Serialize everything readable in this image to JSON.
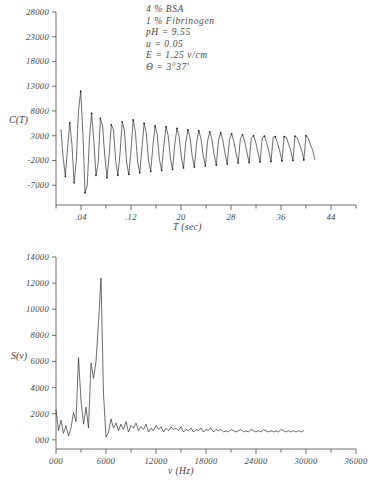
{
  "annotation": {
    "lines": [
      "4 % BSA",
      "1 % Fibrinogen",
      "pH = 9.55",
      "u = 0.05",
      "E = 1.25 v/cm",
      "Θ = 3°37'"
    ]
  },
  "chart_data": [
    {
      "type": "line",
      "title": "",
      "xlabel": "T (sec)",
      "ylabel": "C(T)",
      "xlim": [
        0.0,
        0.48
      ],
      "ylim": [
        -11000,
        28000
      ],
      "xticks": [
        0.04,
        0.12,
        0.2,
        0.28,
        0.36,
        0.44
      ],
      "xtick_labels": [
        ".04",
        ".12",
        "20",
        "28",
        "36",
        "44"
      ],
      "yticks": [
        28000,
        23000,
        18000,
        13000,
        8000,
        3000,
        -2000,
        -7000
      ],
      "ytick_labels": [
        "28000",
        "23000",
        "18000",
        "13000",
        "8000",
        "3000",
        "-2000",
        "-7000"
      ],
      "grid": false,
      "markers": "dots",
      "description": "Damped oscillatory autocorrelation function with decaying envelope and superimposed noise",
      "x": [
        0.008,
        0.0115,
        0.015,
        0.0185,
        0.022,
        0.0255,
        0.029,
        0.0325,
        0.036,
        0.0395,
        0.043,
        0.0465,
        0.05,
        0.0535,
        0.057,
        0.0605,
        0.064,
        0.0675,
        0.071,
        0.0745,
        0.078,
        0.0815,
        0.085,
        0.0885,
        0.092,
        0.0955,
        0.099,
        0.1025,
        0.106,
        0.1095,
        0.113,
        0.1165,
        0.12,
        0.1235,
        0.127,
        0.1305,
        0.134,
        0.1375,
        0.141,
        0.1445,
        0.148,
        0.1515,
        0.155,
        0.1585,
        0.162,
        0.1655,
        0.169,
        0.1725,
        0.176,
        0.1795,
        0.183,
        0.1865,
        0.19,
        0.1935,
        0.197,
        0.2005,
        0.204,
        0.2075,
        0.211,
        0.2145,
        0.218,
        0.2215,
        0.225,
        0.2285,
        0.232,
        0.2355,
        0.239,
        0.2425,
        0.246,
        0.2495,
        0.253,
        0.2565,
        0.26,
        0.2635,
        0.267,
        0.2705,
        0.274,
        0.2775,
        0.281,
        0.2845,
        0.288,
        0.2915,
        0.295,
        0.2985,
        0.302,
        0.3055,
        0.309,
        0.3125,
        0.316,
        0.3195,
        0.323,
        0.3265,
        0.33,
        0.3335,
        0.337,
        0.3405,
        0.344,
        0.3475,
        0.351,
        0.3545,
        0.358,
        0.3615,
        0.365,
        0.3685,
        0.372,
        0.3755,
        0.379,
        0.3825,
        0.386,
        0.3895,
        0.393,
        0.3965,
        0.4,
        0.4035,
        0.407,
        0.4105,
        0.414
      ],
      "y": [
        4200,
        -1500,
        -5200,
        600,
        5600,
        1200,
        -6500,
        -2000,
        8000,
        12000,
        3500,
        -8500,
        -7000,
        2500,
        7500,
        2000,
        -5000,
        -2500,
        6500,
        5000,
        -1000,
        -5500,
        -1000,
        5200,
        4200,
        -2000,
        -5000,
        -500,
        5800,
        4000,
        -2500,
        -4800,
        0,
        6200,
        3800,
        -2200,
        -4500,
        500,
        5500,
        3500,
        -2000,
        -4200,
        800,
        5000,
        3200,
        -1800,
        -4000,
        1000,
        4800,
        3000,
        -1500,
        -3800,
        1200,
        4500,
        2800,
        -1300,
        -3500,
        1500,
        4200,
        2600,
        -1200,
        -3300,
        1700,
        4000,
        2400,
        -1000,
        -3100,
        1900,
        3800,
        2200,
        -800,
        -2900,
        2000,
        3600,
        2000,
        -600,
        -2700,
        2200,
        3400,
        1900,
        -500,
        -2500,
        2400,
        3200,
        1800,
        -400,
        -2400,
        2500,
        3000,
        1700,
        -300,
        -2300,
        2600,
        2900,
        1600,
        -200,
        -2200,
        2700,
        2800,
        1500,
        -100,
        -2100,
        2800,
        2700,
        1400,
        0,
        -2000,
        2900,
        2600,
        1300,
        100,
        -1900,
        3000,
        2500,
        1200,
        200,
        -1800,
        3100
      ]
    },
    {
      "type": "line",
      "title": "",
      "xlabel": "ν (Hz)",
      "ylabel": "S(ν)",
      "xlim": [
        0,
        36000
      ],
      "ylim": [
        -700,
        14000
      ],
      "xticks": [
        0,
        6000,
        12000,
        18000,
        24000,
        30000,
        36000
      ],
      "xtick_labels": [
        "000",
        "6000",
        "12000",
        "18000",
        "24000",
        "30000",
        "36000"
      ],
      "yticks": [
        14000,
        12000,
        10000,
        8000,
        6000,
        4000,
        2000,
        0
      ],
      "ytick_labels": [
        "14000",
        "12000",
        "10000",
        "8000",
        "6000",
        "4000",
        "2000",
        "000"
      ],
      "grid": false,
      "description": "Power spectrum with dominant peak near 5600 Hz reaching about 12400, secondary peaks near 2900 Hz and 4700 Hz, and low noise floor beyond 7000 Hz ending near 30000 Hz",
      "x": [
        0,
        300,
        600,
        900,
        1200,
        1500,
        1800,
        2100,
        2400,
        2700,
        3000,
        3300,
        3600,
        3900,
        4200,
        4500,
        4800,
        5100,
        5400,
        5700,
        6000,
        6300,
        6600,
        6900,
        7200,
        7500,
        7800,
        8100,
        8400,
        8700,
        9000,
        9300,
        9600,
        9900,
        10200,
        10500,
        10800,
        11100,
        11400,
        11700,
        12000,
        12300,
        12600,
        12900,
        13200,
        13500,
        13800,
        14100,
        14400,
        14700,
        15000,
        15300,
        15600,
        15900,
        16200,
        16500,
        16800,
        17100,
        17400,
        17700,
        18000,
        18300,
        18600,
        18900,
        19200,
        19500,
        19800,
        20100,
        20400,
        20700,
        21000,
        21300,
        21600,
        21900,
        22200,
        22500,
        22800,
        23100,
        23400,
        23700,
        24000,
        24300,
        24600,
        24900,
        25200,
        25500,
        25800,
        26100,
        26400,
        26700,
        27000,
        27300,
        27600,
        27900,
        28200,
        28500,
        28800,
        29100,
        29400,
        29700,
        30000
      ],
      "y": [
        2300,
        700,
        1500,
        500,
        1100,
        300,
        900,
        2100,
        1400,
        6300,
        3000,
        1200,
        2500,
        900,
        5900,
        4700,
        6000,
        9000,
        12400,
        3500,
        200,
        600,
        1600,
        900,
        1300,
        700,
        1200,
        800,
        1400,
        600,
        1100,
        900,
        1300,
        700,
        1000,
        800,
        1200,
        600,
        900,
        700,
        1100,
        800,
        1000,
        600,
        900,
        700,
        1000,
        800,
        900,
        700,
        1000,
        600,
        800,
        700,
        900,
        600,
        800,
        700,
        900,
        600,
        800,
        700,
        900,
        600,
        800,
        700,
        800,
        600,
        700,
        600,
        800,
        700,
        600,
        700,
        800,
        600,
        700,
        600,
        800,
        700,
        600,
        700,
        600,
        800,
        700,
        600,
        700,
        600,
        700,
        600,
        800,
        700,
        600,
        700,
        600,
        700,
        600,
        700,
        600,
        700
      ]
    }
  ]
}
